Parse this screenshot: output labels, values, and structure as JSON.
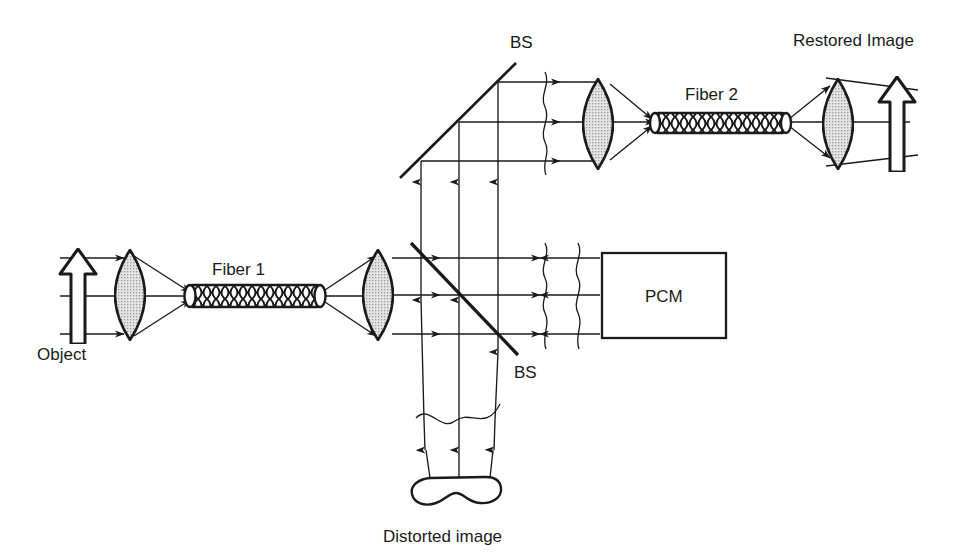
{
  "figure": {
    "type": "optical-ray-diagram",
    "background_color": "#ffffff",
    "ink_color": "#1a1a1a",
    "lens_fill": "#d9d9d9"
  },
  "labels": {
    "object": "Object",
    "fiber1": "Fiber 1",
    "fiber2": "Fiber 2",
    "bs_lower": "BS",
    "bs_upper": "BS",
    "pcm": "PCM",
    "restored_image": "Restored Image",
    "distorted_image": "Distorted image"
  },
  "components": [
    {
      "name": "object-arrow",
      "kind": "hollow-arrow-up",
      "x": 78,
      "y": 295
    },
    {
      "name": "lens-1",
      "kind": "biconvex-lens",
      "x": 130,
      "y": 295
    },
    {
      "name": "fiber-1",
      "kind": "optical-fiber",
      "x1": 186,
      "y1": 296,
      "x2": 324,
      "y2": 296
    },
    {
      "name": "lens-2",
      "kind": "biconvex-lens",
      "x": 378,
      "y": 295
    },
    {
      "name": "beamsplitter-lower",
      "kind": "beamsplitter",
      "x1": 411,
      "y1": 243,
      "x2": 518,
      "y2": 355
    },
    {
      "name": "wavefront-lower-a",
      "kind": "wavy-wavefront",
      "x": 545,
      "y": 295
    },
    {
      "name": "wavefront-lower-b",
      "kind": "wavy-wavefront",
      "x": 578,
      "y": 295
    },
    {
      "name": "pcm-box",
      "kind": "rect",
      "x": 602,
      "y": 253,
      "w": 124,
      "h": 85
    },
    {
      "name": "beamsplitter-upper",
      "kind": "beamsplitter",
      "x1": 400,
      "y1": 178,
      "x2": 516,
      "y2": 63
    },
    {
      "name": "wavefront-upper",
      "kind": "wavy-wavefront",
      "x": 545,
      "y": 122
    },
    {
      "name": "lens-3",
      "kind": "biconvex-lens",
      "x": 597,
      "y": 122
    },
    {
      "name": "fiber-2",
      "kind": "optical-fiber",
      "x1": 651,
      "y1": 123,
      "x2": 789,
      "y2": 123
    },
    {
      "name": "lens-4",
      "kind": "biconvex-lens",
      "x": 838,
      "y": 122
    },
    {
      "name": "restored-arrow",
      "kind": "hollow-arrow-up",
      "x": 897,
      "y": 122
    },
    {
      "name": "distorted-blob",
      "kind": "blob",
      "x": 468,
      "y": 489
    }
  ],
  "beams": {
    "lower_ray_heights": [
      258,
      295,
      334
    ],
    "upper_ray_heights": [
      82,
      122,
      161
    ],
    "vertical_ray_x": [
      421,
      459,
      498
    ]
  }
}
